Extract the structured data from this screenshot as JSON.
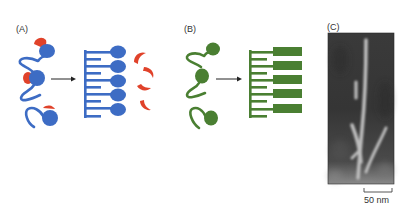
{
  "panels": {
    "a": {
      "label": "(A)",
      "description": "Amyloid-like assembly: free blue proteins with red partners convert into a blue comb-like aggregate releasing red partners",
      "colors": {
        "protein": "#3d6cc4",
        "partner": "#e0422a"
      }
    },
    "b": {
      "label": "(B)",
      "description": "Green proteins convert into a green comb-like fibrillar aggregate",
      "colors": {
        "protein": "#4a7f32"
      }
    },
    "c": {
      "label": "(C)",
      "description": "Electron micrograph of branched fibrils",
      "scale_bar": {
        "label": "50 nm"
      }
    }
  },
  "arrows": [
    "reaction-arrow-a",
    "reaction-arrow-b"
  ]
}
